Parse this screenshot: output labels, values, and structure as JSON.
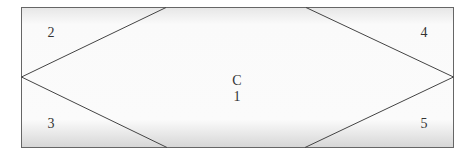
{
  "diagram": {
    "type": "region-partition",
    "center_region": {
      "line1": "C",
      "line2": "1"
    },
    "regions": [
      {
        "id": "top-left",
        "label": "2"
      },
      {
        "id": "bottom-left",
        "label": "3"
      },
      {
        "id": "top-right",
        "label": "4"
      },
      {
        "id": "bottom-right",
        "label": "5"
      }
    ],
    "colors": {
      "stroke": "#555555",
      "fill_gradient_edge": "#d8d8d8",
      "fill_center": "#ffffff"
    }
  }
}
